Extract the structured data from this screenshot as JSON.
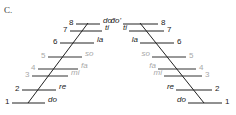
{
  "figure": {
    "caption": "C.",
    "colors": {
      "dark": "#222222",
      "light": "#a8a8a8",
      "line": "#222222"
    },
    "left_ladder": {
      "rungs": [
        {
          "num": "8",
          "syl": "do'",
          "y": 24,
          "x1": 76,
          "x2": 100,
          "muted": false
        },
        {
          "num": "7",
          "syl": "ti",
          "y": 31,
          "x1": 70,
          "x2": 102,
          "muted": false
        },
        {
          "num": "6",
          "syl": "la",
          "y": 43,
          "x1": 60,
          "x2": 94,
          "muted": false
        },
        {
          "num": "5",
          "syl": "so",
          "y": 57,
          "x1": 48,
          "x2": 82,
          "muted": true
        },
        {
          "num": "4",
          "syl": "fa",
          "y": 69,
          "x1": 38,
          "x2": 78,
          "muted": true
        },
        {
          "num": "3",
          "syl": "mi",
          "y": 76,
          "x1": 32,
          "x2": 68,
          "muted": true
        },
        {
          "num": "2",
          "syl": "re",
          "y": 90,
          "x1": 22,
          "x2": 56,
          "muted": false
        },
        {
          "num": "1",
          "syl": "do",
          "y": 103,
          "x1": 12,
          "x2": 45,
          "muted": false
        }
      ],
      "diagonal": {
        "x1": 28,
        "y1": 103,
        "x2": 88,
        "y2": 23
      }
    },
    "right_ladder": {
      "rungs": [
        {
          "num": "8",
          "syl": "do'",
          "y": 24,
          "x1": 123,
          "x2": 158,
          "muted": false
        },
        {
          "num": "7",
          "syl": "ti",
          "y": 31,
          "x1": 129,
          "x2": 164,
          "muted": false
        },
        {
          "num": "6",
          "syl": "la",
          "y": 43,
          "x1": 140,
          "x2": 174,
          "muted": false
        },
        {
          "num": "5",
          "syl": "so",
          "y": 57,
          "x1": 152,
          "x2": 186,
          "muted": true
        },
        {
          "num": "4",
          "syl": "fa",
          "y": 69,
          "x1": 158,
          "x2": 196,
          "muted": true
        },
        {
          "num": "3",
          "syl": "mi",
          "y": 76,
          "x1": 164,
          "x2": 202,
          "muted": true
        },
        {
          "num": "2",
          "syl": "re",
          "y": 90,
          "x1": 176,
          "x2": 212,
          "muted": false
        },
        {
          "num": "1",
          "syl": "do",
          "y": 103,
          "x1": 188,
          "x2": 222,
          "muted": false
        }
      ],
      "diagonal": {
        "x1": 140,
        "y1": 23,
        "x2": 204,
        "y2": 103
      }
    }
  }
}
